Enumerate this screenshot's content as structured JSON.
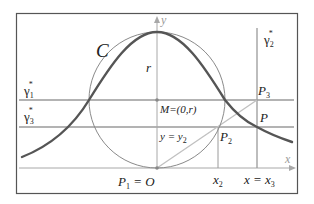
{
  "figure": {
    "colors": {
      "frame": "#555555",
      "curve": "#555555",
      "circle": "#8a8a8a",
      "grid_lines": "#9a9a9a",
      "axis": "#a8a8a8",
      "construction_line": "#c0c0c0",
      "text": "#222222"
    },
    "labels": {
      "curve": "C",
      "radius": "r",
      "y_axis": "y",
      "x_axis": "x",
      "center": "M=(0,r)",
      "line_y2": "y = y",
      "line_y2_sub": "2",
      "origin": "P",
      "origin_sub": "1",
      "origin_eq": " = O",
      "gamma1": "γ",
      "gamma1_sub": "1",
      "gamma1_sup": "*",
      "gamma2": "γ",
      "gamma2_sub": "2",
      "gamma2_sup": "*",
      "gamma3": "γ",
      "gamma3_sub": "3",
      "gamma3_sup": "*",
      "p2": "P",
      "p2_sub": "2",
      "p3": "P",
      "p3_sub": "3",
      "p": "P",
      "x2": "x",
      "x2_sub": "2",
      "x3_eq": "x = x",
      "x3_sub": "3"
    }
  }
}
